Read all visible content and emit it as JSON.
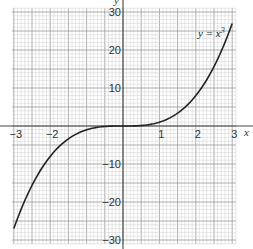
{
  "chart_data": {
    "type": "line",
    "title": "",
    "annotation": "y = x³",
    "xlabel": "x",
    "ylabel": "y",
    "xlim": [
      -3,
      3
    ],
    "ylim": [
      -30,
      30
    ],
    "x_ticks": [
      -3,
      -2,
      -1,
      1,
      2,
      3
    ],
    "x_tick_labels": [
      "−3",
      "−2",
      "",
      "1",
      "2",
      "3"
    ],
    "y_ticks": [
      30,
      20,
      10,
      -10,
      -20,
      -30
    ],
    "y_tick_labels": [
      "30",
      "20",
      "10",
      "−10",
      "−20",
      "−30"
    ],
    "grid": true,
    "grid_style": "graph paper, minor lines every 0.1 x-unit and 1 y-unit, major every 0.5 x-unit / 5 y-units",
    "series": [
      {
        "name": "y = x³",
        "x": [
          -3,
          -2.5,
          -2,
          -1.5,
          -1,
          -0.5,
          0,
          0.5,
          1,
          1.5,
          2,
          2.5,
          3
        ],
        "y": [
          -27,
          -15.625,
          -8,
          -3.375,
          -1,
          -0.125,
          0,
          0.125,
          1,
          3.375,
          8,
          15.625,
          27
        ]
      }
    ],
    "colors": {
      "curve": "#222222",
      "axis": "#444444",
      "grid_minor": "#cfcfcf",
      "grid_major": "#9a9a9a"
    }
  },
  "labels": {
    "equation": "y = x",
    "equation_exp": "3",
    "x_axis": "x",
    "y_axis": "y"
  }
}
